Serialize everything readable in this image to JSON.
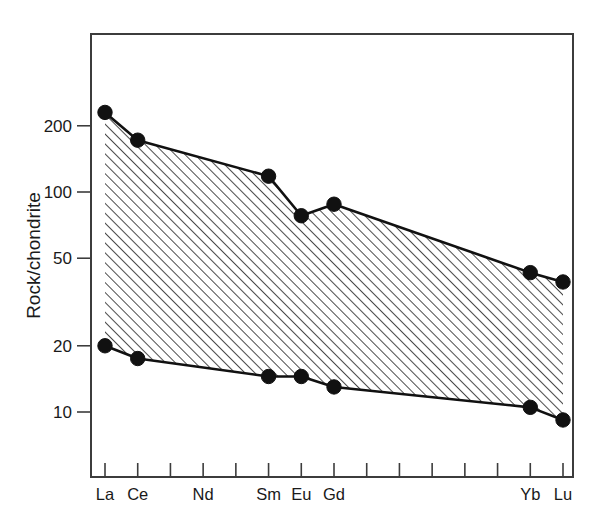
{
  "figure": {
    "background_color": "#ffffff",
    "frame_color": "#3c3c3c",
    "ink_color": "#111111"
  },
  "chart_data": {
    "type": "line",
    "title": "",
    "subtitle": "",
    "xlabel": "",
    "ylabel": "Rock/chondrite",
    "yscale": "log",
    "ylim": [
      6,
      400
    ],
    "grid": false,
    "legend": false,
    "legend_position": "none",
    "annotations": [
      "hatched band between upper and lower envelope curves"
    ],
    "x_positions": [
      "La",
      "Ce",
      "Pr",
      "Nd",
      "Pm",
      "Sm",
      "Eu",
      "Gd",
      "Tb",
      "Dy",
      "Ho",
      "Er",
      "Tm",
      "Yb",
      "Lu"
    ],
    "x_tick_labels": [
      "La",
      "Ce",
      "",
      "Nd",
      "",
      "Sm",
      "Eu",
      "Gd",
      "",
      "",
      "",
      "",
      "",
      "Yb",
      "Lu"
    ],
    "y_tick_values": [
      200,
      100,
      50,
      20,
      10
    ],
    "y_tick_labels": [
      "200",
      "100",
      "50",
      "20",
      "10"
    ],
    "series": [
      {
        "name": "upper envelope",
        "marker": "filled-circle",
        "categories": [
          "La",
          "Ce",
          "Sm",
          "Eu",
          "Gd",
          "Yb",
          "Lu"
        ],
        "values": [
          230,
          172,
          118,
          78,
          88,
          43,
          39
        ]
      },
      {
        "name": "lower envelope",
        "marker": "filled-circle",
        "categories": [
          "La",
          "Ce",
          "Sm",
          "Eu",
          "Gd",
          "Yb",
          "Lu"
        ],
        "values": [
          20,
          17.5,
          14.5,
          14.5,
          13,
          10.5,
          9.2
        ]
      }
    ]
  },
  "plot_geometry": {
    "frame_left": 91,
    "frame_right": 573,
    "frame_top": 34,
    "frame_bottom": 477,
    "data_left": 105,
    "data_right": 563,
    "y_ref_value": 100,
    "y_ref_pixel": 192,
    "pixels_per_decade": 220,
    "hatch_angle_degrees": 45,
    "hatch_spacing_px": 7
  },
  "axis_title": {
    "y": "Rock/chondrite"
  }
}
